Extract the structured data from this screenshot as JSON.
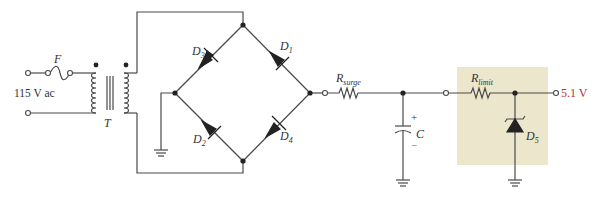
{
  "diagram": {
    "type": "circuit-schematic",
    "colors": {
      "wire": "#4a4a4a",
      "regulator_box": "#ece7cc",
      "output_label": "#b5303a",
      "capacitor_minus": "#c8464a"
    },
    "labels": {
      "fuse": "F",
      "input": "115 V ac",
      "transformer": "T",
      "d1": "D",
      "d1_sub": "1",
      "d2": "D",
      "d2_sub": "2",
      "d3": "D",
      "d3_sub": "3",
      "d4": "D",
      "d4_sub": "4",
      "d5": "D",
      "d5_sub": "5",
      "rsurge": "R",
      "rsurge_sub": "surge",
      "rlimit": "R",
      "rlimit_sub": "limit",
      "capacitor": "C",
      "cap_plus": "+",
      "cap_minus": "−",
      "output": "5.1 V"
    }
  }
}
